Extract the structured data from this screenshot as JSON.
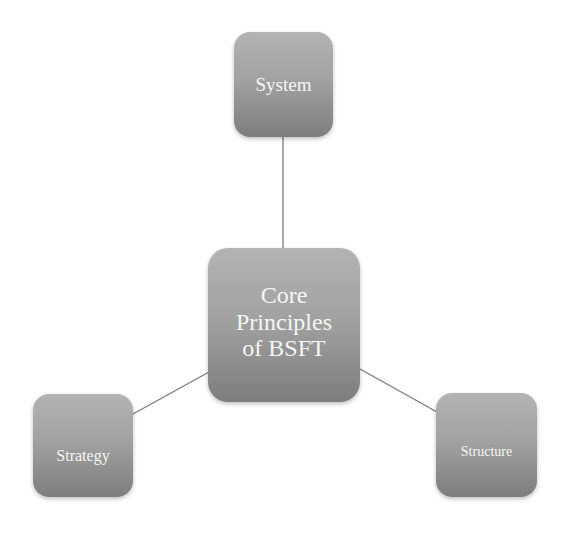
{
  "diagram": {
    "type": "hub-and-spoke",
    "center": {
      "label_lines": [
        "Core",
        "Principles",
        "of BSFT"
      ],
      "label": "Core Principles of BSFT"
    },
    "nodes": [
      {
        "id": "system",
        "label": "System",
        "position": "top"
      },
      {
        "id": "strategy",
        "label": "Strategy",
        "position": "bottom-left"
      },
      {
        "id": "structure",
        "label": "Structure",
        "position": "bottom-right"
      }
    ],
    "edges": [
      {
        "from": "core",
        "to": "system"
      },
      {
        "from": "core",
        "to": "strategy"
      },
      {
        "from": "core",
        "to": "structure"
      }
    ],
    "colors": {
      "node_gradient_top": "#b3b3b3",
      "node_gradient_bottom": "#7d7d7d",
      "node_text": "#f6f6f6",
      "connector": "#7a7a7a",
      "background": "#ffffff"
    }
  }
}
